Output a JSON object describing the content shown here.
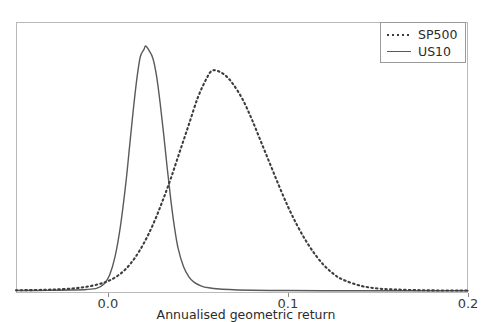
{
  "figure": {
    "background_color": "#ffffff",
    "frame_color": "#b9b9b9",
    "top_artifact_text": " "
  },
  "axes": {
    "x_title": "Annualised geometric return",
    "x_ticks": [
      {
        "label": "0.0",
        "value": 0.0
      },
      {
        "label": "0.1",
        "value": 0.1
      },
      {
        "label": "0.2",
        "value": 0.2
      }
    ],
    "y_ticks": [],
    "y_title": ""
  },
  "legend": {
    "position": "upper-right",
    "entries": [
      {
        "label": "SP500",
        "style": "dotted",
        "color": "#3d3d3d"
      },
      {
        "label": "US10",
        "style": "solid",
        "color": "#5a5a5a"
      }
    ]
  },
  "chart_data": {
    "type": "line",
    "title": "",
    "subtitle": "",
    "xlabel": "Annualised geometric return",
    "ylabel": "",
    "xlim": [
      -0.051,
      0.2
    ],
    "ylim": [
      0,
      1.0
    ],
    "grid": false,
    "legend_position": "upper right",
    "xtick_labels": [
      "0.0",
      "0.1",
      "0.2"
    ],
    "xtick_values": [
      0.0,
      0.1,
      0.2
    ],
    "ytick_labels": [],
    "annotations": [],
    "note": "Kernel density estimates of simulated annualised geometric returns. y-axis is an unlabelled density scale; values below are normalised to the tallest peak = 1.0",
    "series": [
      {
        "name": "SP500",
        "style": "dotted",
        "color": "#3d3d3d",
        "peak_x": 0.058,
        "peak_y": 0.9,
        "x": [
          -0.051,
          -0.04,
          -0.03,
          -0.02,
          -0.012,
          -0.005,
          0.0,
          0.005,
          0.01,
          0.015,
          0.02,
          0.025,
          0.03,
          0.035,
          0.04,
          0.045,
          0.05,
          0.055,
          0.058,
          0.062,
          0.066,
          0.07,
          0.075,
          0.08,
          0.085,
          0.09,
          0.095,
          0.1,
          0.105,
          0.11,
          0.115,
          0.12,
          0.125,
          0.13,
          0.14,
          0.15,
          0.16,
          0.175,
          0.19,
          0.2
        ],
        "y": [
          0.003,
          0.004,
          0.006,
          0.01,
          0.017,
          0.028,
          0.04,
          0.06,
          0.09,
          0.135,
          0.195,
          0.27,
          0.36,
          0.46,
          0.57,
          0.68,
          0.79,
          0.87,
          0.9,
          0.895,
          0.875,
          0.84,
          0.78,
          0.7,
          0.61,
          0.52,
          0.43,
          0.345,
          0.27,
          0.205,
          0.15,
          0.105,
          0.072,
          0.048,
          0.022,
          0.01,
          0.006,
          0.003,
          0.002,
          0.002
        ]
      },
      {
        "name": "US10",
        "style": "solid",
        "color": "#5a5a5a",
        "peak_x": 0.021,
        "peak_y": 1.0,
        "x": [
          -0.051,
          -0.04,
          -0.03,
          -0.02,
          -0.012,
          -0.006,
          -0.002,
          0.001,
          0.004,
          0.007,
          0.01,
          0.012,
          0.014,
          0.016,
          0.018,
          0.02,
          0.021,
          0.023,
          0.025,
          0.027,
          0.029,
          0.031,
          0.033,
          0.035,
          0.037,
          0.039,
          0.042,
          0.045,
          0.048,
          0.052,
          0.056,
          0.062,
          0.07,
          0.08,
          0.09,
          0.1,
          0.12,
          0.15,
          0.175,
          0.2
        ],
        "y": [
          0.002,
          0.002,
          0.003,
          0.004,
          0.006,
          0.012,
          0.03,
          0.065,
          0.14,
          0.265,
          0.44,
          0.585,
          0.73,
          0.86,
          0.955,
          0.985,
          1.0,
          0.98,
          0.95,
          0.88,
          0.77,
          0.64,
          0.5,
          0.37,
          0.26,
          0.175,
          0.1,
          0.058,
          0.035,
          0.02,
          0.013,
          0.008,
          0.005,
          0.003,
          0.002,
          0.002,
          0.001,
          0.001,
          0.001,
          0.001
        ]
      }
    ]
  }
}
